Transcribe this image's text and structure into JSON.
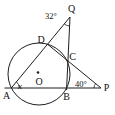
{
  "figure": {
    "colors": {
      "line": "#1f1f1f",
      "text": "#111111",
      "background": "#ffffff"
    },
    "points": {
      "A": "A",
      "B": "B",
      "C": "C",
      "D": "D",
      "O": "O",
      "P": "P",
      "Q": "Q"
    },
    "angle_labels": {
      "at_Q": "32°",
      "at_P": "40°",
      "at_A": "x"
    }
  }
}
